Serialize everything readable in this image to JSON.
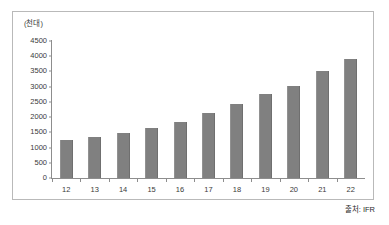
{
  "chart_data": {
    "type": "bar",
    "title": "",
    "subtitle": "",
    "xlabel": "",
    "ylabel": "(천대)",
    "unit_label": "(천대)",
    "categories": [
      "12",
      "13",
      "14",
      "15",
      "16",
      "17",
      "18",
      "19",
      "20",
      "21",
      "22"
    ],
    "values": [
      1235,
      1340,
      1480,
      1630,
      1840,
      2120,
      2440,
      2760,
      3030,
      3500,
      3920
    ],
    "series": [
      {
        "name": "",
        "values": [
          1235,
          1340,
          1480,
          1630,
          1840,
          2120,
          2440,
          2760,
          3030,
          3500,
          3920
        ]
      }
    ],
    "ylim": [
      0,
      4500
    ],
    "yticks": [
      0,
      500,
      1000,
      1500,
      2000,
      2500,
      3000,
      3500,
      4000,
      4500
    ],
    "ytick_labels": [
      "0",
      "500",
      "1000",
      "1500",
      "2000",
      "2500",
      "3000",
      "3500",
      "4000",
      "4500"
    ],
    "grid": false,
    "legend": null,
    "legend_position": "none",
    "bar_color": "#808080",
    "axis_color": "#8d8d8d",
    "text_color": "#3a3a3a",
    "background": "#ffffff",
    "annotations": [
      {
        "name": "source",
        "text": "출처: IFR",
        "position": "bottom-right"
      }
    ]
  },
  "source_note": "출처: IFR"
}
